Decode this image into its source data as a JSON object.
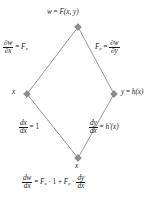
{
  "figure": {
    "name": "chain-rule-tree-diagram",
    "colors": {
      "edge": "#8c8c8c",
      "node": "#8c8c8c",
      "text": "#1a1a1a",
      "background": "#ffffff"
    },
    "nodes": {
      "top": {
        "label_lhs": "w",
        "label_eq": "=",
        "label_rhs": "F(x, y)",
        "full": "w = F(x, y)",
        "x": 78,
        "y": 27
      },
      "left": {
        "label": "x",
        "x": 27,
        "y": 94
      },
      "right": {
        "label_lhs": "y",
        "label_eq": "=",
        "label_rhs": "h(x)",
        "full": "y = h(x)",
        "x": 114,
        "y": 94
      },
      "bottom": {
        "label": "x",
        "x": 78,
        "y": 158
      }
    },
    "edges": [
      {
        "name": "edge-top-left",
        "from": "top",
        "to": "left",
        "label": {
          "numerator": "∂w",
          "denominator": "∂x",
          "equals": "=",
          "rhs_base": "F",
          "rhs_sub": "x",
          "full": "∂w/∂x = Fₓ"
        }
      },
      {
        "name": "edge-top-right",
        "from": "top",
        "to": "right",
        "label": {
          "lhs_base": "F",
          "lhs_sub": "y",
          "equals": "=",
          "numerator": "∂w",
          "denominator": "∂y",
          "full": "Fᵧ = ∂w/∂y"
        }
      },
      {
        "name": "edge-left-bottom",
        "from": "left",
        "to": "bottom",
        "label": {
          "numerator": "dx",
          "denominator": "dx",
          "equals": "=",
          "rhs": "1",
          "full": "dx/dx = 1"
        }
      },
      {
        "name": "edge-right-bottom",
        "from": "right",
        "to": "bottom",
        "label": {
          "numerator": "dy",
          "denominator": "dx",
          "equals": "=",
          "rhs": "h′(x)",
          "full": "dy/dx = h′(x)"
        }
      }
    ],
    "result_equation": {
      "lhs_num": "dw",
      "lhs_den": "dx",
      "equals": "=",
      "term1_base": "F",
      "term1_sub": "x",
      "dot1": "·",
      "term1_factor": "1",
      "plus": "+",
      "term2_base": "F",
      "term2_sub": "y",
      "dot2": "·",
      "term2_num": "dy",
      "term2_den": "dx",
      "full": "dw/dx = Fₓ · 1 + Fᵧ · dy/dx"
    }
  }
}
